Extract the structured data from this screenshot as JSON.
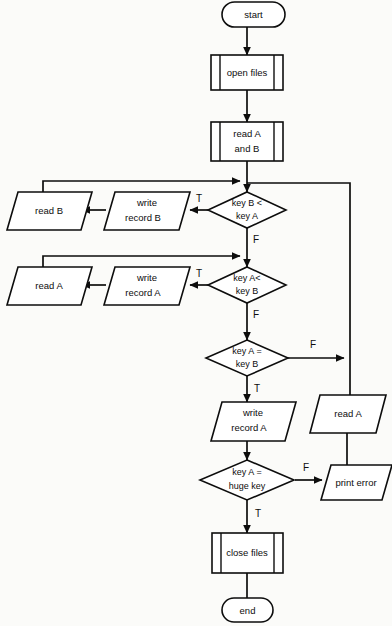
{
  "diagram": {
    "type": "flowchart",
    "colors": {
      "stroke": "#0d0d0d",
      "fill": "#ffffff",
      "background": "#fbfbf9"
    },
    "nodes": [
      {
        "id": "start",
        "kind": "terminator",
        "label": "start",
        "lines": [
          "start"
        ]
      },
      {
        "id": "open_files",
        "kind": "predefined-process",
        "label": "open files",
        "lines": [
          "open files"
        ]
      },
      {
        "id": "read_a_and_b",
        "kind": "predefined-process",
        "label": "read A and B",
        "lines": [
          "read A",
          "and B"
        ]
      },
      {
        "id": "dec_b_lt_a",
        "kind": "decision",
        "label": "key B < key A",
        "lines": [
          "key B <",
          "key A"
        ]
      },
      {
        "id": "write_rec_b",
        "kind": "io",
        "label": "write record B",
        "lines": [
          "write",
          "record B"
        ]
      },
      {
        "id": "read_b",
        "kind": "io",
        "label": "read B",
        "lines": [
          "read B"
        ]
      },
      {
        "id": "dec_a_lt_b",
        "kind": "decision",
        "label": "key A< key B",
        "lines": [
          "key A<",
          "key B"
        ]
      },
      {
        "id": "write_rec_a",
        "kind": "io",
        "label": "write record A",
        "lines": [
          "write",
          "record A"
        ]
      },
      {
        "id": "read_a_left",
        "kind": "io",
        "label": "read A",
        "lines": [
          "read A"
        ]
      },
      {
        "id": "dec_a_eq_b",
        "kind": "decision",
        "label": "key A = key B",
        "lines": [
          "key A =",
          "key B"
        ]
      },
      {
        "id": "write_rec_a2",
        "kind": "io",
        "label": "write record A",
        "lines": [
          "write",
          "record A"
        ]
      },
      {
        "id": "read_a_right",
        "kind": "io",
        "label": "read A",
        "lines": [
          "read A"
        ]
      },
      {
        "id": "dec_huge_key",
        "kind": "decision",
        "label": "key A = huge key",
        "lines": [
          "key A =",
          "huge key"
        ]
      },
      {
        "id": "print_error",
        "kind": "io",
        "label": "print error",
        "lines": [
          "print error"
        ]
      },
      {
        "id": "close_files",
        "kind": "predefined-process",
        "label": "close files",
        "lines": [
          "close files"
        ]
      },
      {
        "id": "end",
        "kind": "terminator",
        "label": "end",
        "lines": [
          "end"
        ]
      }
    ],
    "branch_labels": [
      {
        "id": "t1",
        "text": "T",
        "from": "dec_b_lt_a",
        "to": "write_rec_b"
      },
      {
        "id": "f1",
        "text": "F",
        "from": "dec_b_lt_a",
        "to": "dec_a_lt_b"
      },
      {
        "id": "t2",
        "text": "T",
        "from": "dec_a_lt_b",
        "to": "write_rec_a"
      },
      {
        "id": "f2",
        "text": "F",
        "from": "dec_a_lt_b",
        "to": "dec_a_eq_b"
      },
      {
        "id": "f3",
        "text": "F",
        "from": "dec_a_eq_b",
        "to": "read_a_right"
      },
      {
        "id": "t3",
        "text": "T",
        "from": "dec_a_eq_b",
        "to": "write_rec_a2"
      },
      {
        "id": "f4",
        "text": "F",
        "from": "dec_huge_key",
        "to": "print_error"
      },
      {
        "id": "t4",
        "text": "T",
        "from": "dec_huge_key",
        "to": "close_files"
      }
    ]
  }
}
